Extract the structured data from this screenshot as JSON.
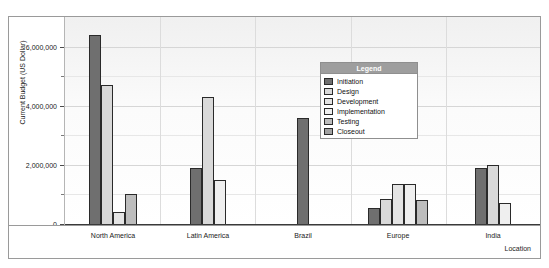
{
  "top_strip_text": "",
  "chart_data": {
    "type": "bar",
    "title": "",
    "xlabel": "Location",
    "ylabel": "Current Budget (US Dollar)",
    "ylim": [
      0,
      7000000
    ],
    "grid": true,
    "legend_title": "Legend",
    "legend_position": "inside-top-center",
    "y_ticks": [
      {
        "value": 0,
        "label": "0",
        "major": true
      },
      {
        "value": 1000000,
        "label": "",
        "major": false
      },
      {
        "value": 2000000,
        "label": "2,000,000",
        "major": true
      },
      {
        "value": 3000000,
        "label": "",
        "major": false
      },
      {
        "value": 4000000,
        "label": "4,000,000",
        "major": true
      },
      {
        "value": 5000000,
        "label": "",
        "major": false
      },
      {
        "value": 6000000,
        "label": "6,000,000",
        "major": true
      }
    ],
    "categories": [
      "North America",
      "Latin America",
      "Brazil",
      "Europe",
      "India"
    ],
    "series": [
      {
        "name": "Initiation",
        "color": "#6f6f6f",
        "values": [
          6400000,
          1900000,
          3600000,
          550000,
          1900000
        ]
      },
      {
        "name": "Design",
        "color": "#d9d9d9",
        "values": [
          4700000,
          4300000,
          0,
          850000,
          2000000
        ]
      },
      {
        "name": "Development",
        "color": "#e4e4e4",
        "values": [
          400000,
          0,
          0,
          1350000,
          0
        ]
      },
      {
        "name": "Implementation",
        "color": "#efefef",
        "values": [
          0,
          1500000,
          0,
          1350000,
          700000
        ]
      },
      {
        "name": "Testing",
        "color": "#bdbdbd",
        "values": [
          1000000,
          0,
          0,
          800000,
          0
        ]
      },
      {
        "name": "Closeout",
        "color": "#a3a3a3",
        "values": [
          0,
          0,
          0,
          0,
          0
        ]
      }
    ]
  }
}
